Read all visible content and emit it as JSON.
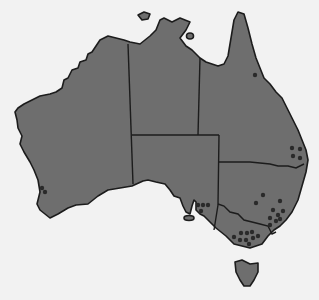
{
  "map": {
    "title": "Australia",
    "colors": {
      "background": "#f2f2f2",
      "land": "#6e6e6e",
      "outline": "#1c1c1c",
      "marker": "#2a2a2a"
    },
    "regions": [
      {
        "id": "WA",
        "name": "Western Australia"
      },
      {
        "id": "NT",
        "name": "Northern Territory"
      },
      {
        "id": "QLD",
        "name": "Queensland"
      },
      {
        "id": "SA",
        "name": "South Australia"
      },
      {
        "id": "NSW",
        "name": "New South Wales"
      },
      {
        "id": "VIC",
        "name": "Victoria"
      },
      {
        "id": "TAS",
        "name": "Tasmania"
      }
    ],
    "markers": [
      {
        "region": "WA",
        "x": 42,
        "y": 188
      },
      {
        "region": "WA",
        "x": 45,
        "y": 192
      },
      {
        "region": "QLD",
        "x": 255,
        "y": 75
      },
      {
        "region": "QLD",
        "x": 292,
        "y": 148
      },
      {
        "region": "QLD",
        "x": 300,
        "y": 149
      },
      {
        "region": "QLD",
        "x": 293,
        "y": 156
      },
      {
        "region": "QLD",
        "x": 300,
        "y": 158
      },
      {
        "region": "NSW",
        "x": 263,
        "y": 195
      },
      {
        "region": "NSW",
        "x": 256,
        "y": 203
      },
      {
        "region": "NSW",
        "x": 280,
        "y": 201
      },
      {
        "region": "NSW",
        "x": 273,
        "y": 210
      },
      {
        "region": "NSW",
        "x": 283,
        "y": 211
      },
      {
        "region": "NSW",
        "x": 270,
        "y": 218
      },
      {
        "region": "NSW",
        "x": 278,
        "y": 215
      },
      {
        "region": "NSW",
        "x": 280,
        "y": 219
      },
      {
        "region": "NSW",
        "x": 276,
        "y": 221
      },
      {
        "region": "NSW",
        "x": 270,
        "y": 225
      },
      {
        "region": "SA",
        "x": 198,
        "y": 205
      },
      {
        "region": "SA",
        "x": 203,
        "y": 205
      },
      {
        "region": "SA",
        "x": 208,
        "y": 205
      },
      {
        "region": "SA",
        "x": 201,
        "y": 211
      },
      {
        "region": "VIC",
        "x": 234,
        "y": 237
      },
      {
        "region": "VIC",
        "x": 241,
        "y": 233
      },
      {
        "region": "VIC",
        "x": 247,
        "y": 233
      },
      {
        "region": "VIC",
        "x": 252,
        "y": 232
      },
      {
        "region": "VIC",
        "x": 240,
        "y": 240
      },
      {
        "region": "VIC",
        "x": 246,
        "y": 240
      },
      {
        "region": "VIC",
        "x": 253,
        "y": 238
      },
      {
        "region": "VIC",
        "x": 258,
        "y": 236
      },
      {
        "region": "VIC",
        "x": 249,
        "y": 244
      }
    ]
  }
}
